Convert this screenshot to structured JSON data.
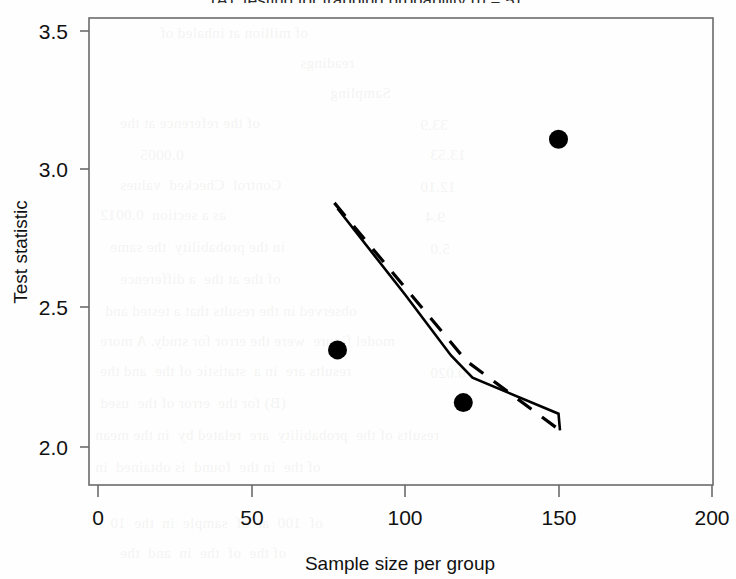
{
  "page": {
    "clipped_top_text": "(A), testing for trapping probability (n = 5),",
    "background_note": "scanned-page-bleed-through"
  },
  "chart_data": {
    "type": "scatter",
    "title": "",
    "xlabel": "Sample size per group",
    "ylabel": "Test statistic",
    "xlim": [
      0,
      200
    ],
    "ylim": [
      1.95,
      3.62
    ],
    "xticks": [
      0,
      50,
      100,
      150,
      200
    ],
    "xtick_labels": [
      "0",
      "50",
      "100",
      "150",
      "200"
    ],
    "yticks": [
      2.0,
      2.5,
      3.0,
      3.5
    ],
    "ytick_labels": [
      "2.0",
      "2.5",
      "3.0",
      "3.5"
    ],
    "grid": false,
    "legend": "none",
    "frame": true,
    "series": [
      {
        "name": "observed points",
        "type": "scatter",
        "marker": "filled-circle",
        "color": "#000000",
        "points": [
          {
            "x": 78,
            "y": 2.35
          },
          {
            "x": 119,
            "y": 2.16
          },
          {
            "x": 150,
            "y": 3.11
          }
        ]
      },
      {
        "name": "solid trend line",
        "type": "line",
        "style": "solid",
        "color": "#000000",
        "points": [
          {
            "x": 78,
            "y": 2.86
          },
          {
            "x": 100,
            "y": 2.55
          },
          {
            "x": 115,
            "y": 2.33
          },
          {
            "x": 122,
            "y": 2.25
          },
          {
            "x": 150,
            "y": 2.12
          },
          {
            "x": 150.5,
            "y": 2.06
          }
        ]
      },
      {
        "name": "dashed trend line",
        "type": "line",
        "style": "dashed",
        "color": "#000000",
        "points": [
          {
            "x": 77,
            "y": 2.88
          },
          {
            "x": 120,
            "y": 2.31
          },
          {
            "x": 150.5,
            "y": 2.06
          }
        ]
      }
    ]
  },
  "axis": {
    "y_title": "Test statistic",
    "x_title": "Sample size per group"
  }
}
